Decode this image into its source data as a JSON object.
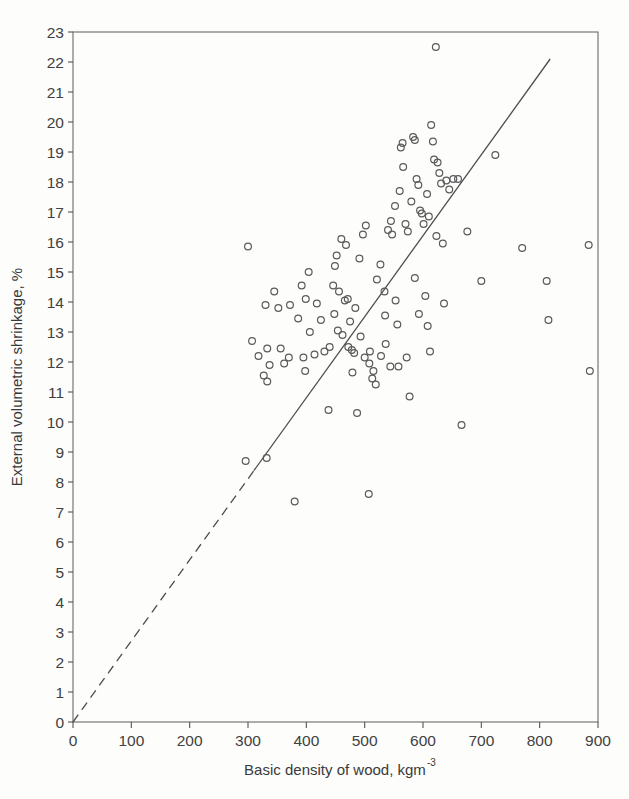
{
  "chart_data": {
    "type": "scatter",
    "title": "",
    "xlabel": "Basic density of wood, kgm",
    "xlabel_superscript": "-3",
    "ylabel": "External volumetric shrinkage, %",
    "xlim": [
      0,
      900
    ],
    "ylim": [
      0,
      23
    ],
    "xticks": [
      0,
      100,
      200,
      300,
      400,
      500,
      600,
      700,
      800,
      900
    ],
    "yticks": [
      0,
      1,
      2,
      3,
      4,
      5,
      6,
      7,
      8,
      9,
      10,
      11,
      12,
      13,
      14,
      15,
      16,
      17,
      18,
      19,
      20,
      21,
      22,
      23
    ],
    "xticklabels": [
      "0",
      "100",
      "200",
      "300",
      "400",
      "500",
      "600",
      "700",
      "800",
      "900"
    ],
    "yticklabels": [
      "0",
      "1",
      "2",
      "3",
      "4",
      "5",
      "6",
      "7",
      "8",
      "9",
      "10",
      "11",
      "12",
      "13",
      "14",
      "15",
      "16",
      "17",
      "18",
      "19",
      "20",
      "21",
      "22",
      "23"
    ],
    "grid": false,
    "legend": null,
    "frame": true,
    "marker": {
      "shape": "open-circle",
      "radius": 3.4,
      "stroke": "#5a5a5a",
      "fill": "none",
      "stroke_width": 1.2
    },
    "points": [
      [
        296,
        8.7
      ],
      [
        332,
        8.8
      ],
      [
        380,
        7.35
      ],
      [
        507,
        7.6
      ],
      [
        300,
        15.85
      ],
      [
        330,
        13.9
      ],
      [
        307,
        12.7
      ],
      [
        318,
        12.2
      ],
      [
        333,
        12.45
      ],
      [
        337,
        11.9
      ],
      [
        327,
        11.55
      ],
      [
        333,
        11.35
      ],
      [
        352,
        13.8
      ],
      [
        372,
        13.9
      ],
      [
        386,
        13.45
      ],
      [
        399,
        14.1
      ],
      [
        406,
        13.0
      ],
      [
        395,
        12.15
      ],
      [
        398,
        11.7
      ],
      [
        370,
        12.15
      ],
      [
        438,
        10.4
      ],
      [
        446,
        14.55
      ],
      [
        449,
        15.2
      ],
      [
        452,
        15.55
      ],
      [
        456,
        14.35
      ],
      [
        448,
        13.6
      ],
      [
        454,
        13.05
      ],
      [
        462,
        12.9
      ],
      [
        466,
        14.05
      ],
      [
        471,
        14.1
      ],
      [
        472,
        12.5
      ],
      [
        478,
        12.4
      ],
      [
        479,
        11.65
      ],
      [
        482,
        12.3
      ],
      [
        487,
        10.3
      ],
      [
        491,
        15.45
      ],
      [
        497,
        16.25
      ],
      [
        502,
        16.55
      ],
      [
        508,
        11.95
      ],
      [
        509,
        12.35
      ],
      [
        513,
        11.45
      ],
      [
        515,
        11.7
      ],
      [
        519,
        11.25
      ],
      [
        528,
        12.2
      ],
      [
        534,
        14.35
      ],
      [
        535,
        13.55
      ],
      [
        540,
        16.4
      ],
      [
        545,
        16.7
      ],
      [
        547,
        16.25
      ],
      [
        552,
        17.2
      ],
      [
        553,
        14.05
      ],
      [
        556,
        13.25
      ],
      [
        560,
        17.7
      ],
      [
        562,
        19.15
      ],
      [
        565,
        19.3
      ],
      [
        566,
        18.5
      ],
      [
        570,
        16.6
      ],
      [
        574,
        16.35
      ],
      [
        577,
        10.85
      ],
      [
        580,
        17.35
      ],
      [
        583,
        19.5
      ],
      [
        586,
        19.4
      ],
      [
        589,
        18.1
      ],
      [
        592,
        17.9
      ],
      [
        595,
        17.05
      ],
      [
        598,
        16.95
      ],
      [
        601,
        16.6
      ],
      [
        604,
        14.2
      ],
      [
        608,
        13.2
      ],
      [
        612,
        12.35
      ],
      [
        614,
        19.9
      ],
      [
        617,
        19.35
      ],
      [
        619,
        18.75
      ],
      [
        622,
        22.5
      ],
      [
        625,
        18.65
      ],
      [
        628,
        18.3
      ],
      [
        631,
        17.95
      ],
      [
        634,
        15.95
      ],
      [
        640,
        18.05
      ],
      [
        645,
        17.75
      ],
      [
        652,
        18.1
      ],
      [
        660,
        18.1
      ],
      [
        666,
        9.9
      ],
      [
        676,
        16.35
      ],
      [
        700,
        14.7
      ],
      [
        724,
        18.9
      ],
      [
        770,
        15.8
      ],
      [
        812,
        14.7
      ],
      [
        815,
        13.4
      ],
      [
        884,
        15.9
      ],
      [
        886,
        11.7
      ],
      [
        345,
        14.35
      ],
      [
        356,
        12.45
      ],
      [
        362,
        11.95
      ],
      [
        418,
        13.95
      ],
      [
        425,
        13.4
      ],
      [
        431,
        12.35
      ],
      [
        440,
        12.5
      ],
      [
        460,
        16.1
      ],
      [
        468,
        15.9
      ],
      [
        493,
        12.85
      ],
      [
        500,
        12.15
      ],
      [
        521,
        14.75
      ],
      [
        527,
        15.25
      ],
      [
        536,
        12.6
      ],
      [
        544,
        11.85
      ],
      [
        558,
        11.85
      ],
      [
        572,
        12.15
      ],
      [
        586,
        14.8
      ],
      [
        593,
        13.6
      ],
      [
        607,
        17.6
      ],
      [
        610,
        16.85
      ],
      [
        623,
        16.2
      ],
      [
        636,
        13.95
      ],
      [
        392,
        14.55
      ],
      [
        404,
        15.0
      ],
      [
        414,
        12.25
      ],
      [
        475,
        13.35
      ],
      [
        484,
        13.8
      ]
    ],
    "regression_line": {
      "x_start": 0,
      "y_start": 0,
      "x_end": 818,
      "y_end": 22.1,
      "dashed_until_x": 310,
      "color": "#4d4d4d",
      "width": 1.3
    },
    "axis_color": "#555555",
    "text_color": "#414141"
  }
}
